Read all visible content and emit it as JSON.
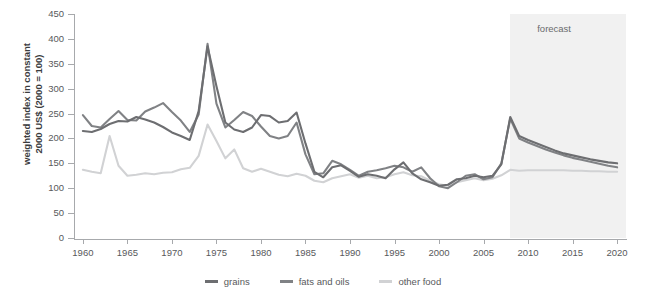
{
  "chart_data": {
    "type": "line",
    "title": "",
    "xlabel": "",
    "ylabel": "weighted index in constant\n2000 US$ (2000 = 100)",
    "xlim": [
      1959,
      2021
    ],
    "ylim": [
      0,
      450
    ],
    "ytick_values": [
      0,
      50,
      100,
      150,
      200,
      250,
      300,
      350,
      400,
      450
    ],
    "ytick_labels": [
      "0",
      "50",
      "100",
      "150",
      "200",
      "250",
      "300",
      "350",
      "400",
      "450"
    ],
    "xtick_values": [
      1960,
      1965,
      1970,
      1975,
      1980,
      1985,
      1990,
      1995,
      2000,
      2005,
      2010,
      2015,
      2020
    ],
    "xtick_labels": [
      "1960",
      "1965",
      "1970",
      "1975",
      "1980",
      "1985",
      "1990",
      "1995",
      "2000",
      "2005",
      "2010",
      "2015",
      "2020"
    ],
    "grid": false,
    "legend_position": "bottom-center",
    "annotations": [
      {
        "text": "forecast",
        "x": 2013.5,
        "y": 420,
        "name": "forecast-annotation"
      }
    ],
    "shaded_regions": [
      {
        "name": "forecast-band",
        "x_start": 2008,
        "x_end": 2021,
        "color": "#f1f1f1"
      }
    ],
    "x": [
      1960,
      1961,
      1962,
      1963,
      1964,
      1965,
      1966,
      1967,
      1968,
      1969,
      1970,
      1971,
      1972,
      1973,
      1974,
      1975,
      1976,
      1977,
      1978,
      1979,
      1980,
      1981,
      1982,
      1983,
      1984,
      1985,
      1986,
      1987,
      1988,
      1989,
      1990,
      1991,
      1992,
      1993,
      1994,
      1995,
      1996,
      1997,
      1998,
      1999,
      2000,
      2001,
      2002,
      2003,
      2004,
      2005,
      2006,
      2007,
      2008,
      2009,
      2010,
      2011,
      2012,
      2013,
      2014,
      2015,
      2016,
      2017,
      2018,
      2019,
      2020
    ],
    "series": [
      {
        "name": "grains",
        "color": "#6d6e71",
        "values": [
          215,
          213,
          219,
          229,
          235,
          234,
          243,
          238,
          232,
          223,
          212,
          205,
          197,
          255,
          385,
          305,
          232,
          218,
          213,
          222,
          247,
          245,
          232,
          235,
          252,
          190,
          133,
          122,
          142,
          146,
          135,
          123,
          128,
          125,
          120,
          138,
          152,
          130,
          118,
          112,
          105,
          107,
          118,
          120,
          125,
          122,
          125,
          148,
          243,
          205,
          197,
          190,
          183,
          176,
          170,
          166,
          162,
          158,
          155,
          152,
          150
        ]
      },
      {
        "name": "fats and oils",
        "color": "#808285",
        "values": [
          247,
          225,
          222,
          239,
          255,
          237,
          236,
          254,
          262,
          271,
          253,
          236,
          213,
          248,
          390,
          270,
          222,
          237,
          253,
          245,
          224,
          205,
          200,
          205,
          232,
          168,
          128,
          130,
          155,
          148,
          137,
          125,
          133,
          136,
          140,
          145,
          142,
          133,
          142,
          120,
          104,
          100,
          112,
          125,
          128,
          118,
          122,
          150,
          240,
          200,
          192,
          185,
          178,
          172,
          166,
          161,
          157,
          153,
          149,
          145,
          142
        ]
      },
      {
        "name": "other food",
        "color": "#d1d2d4",
        "values": [
          137,
          133,
          130,
          205,
          145,
          125,
          127,
          130,
          128,
          131,
          132,
          138,
          141,
          165,
          228,
          195,
          160,
          178,
          140,
          133,
          139,
          133,
          127,
          124,
          129,
          125,
          115,
          112,
          120,
          124,
          128,
          121,
          125,
          120,
          122,
          128,
          132,
          126,
          124,
          115,
          108,
          105,
          112,
          116,
          120,
          116,
          119,
          126,
          137,
          135,
          136,
          136,
          136,
          136,
          136,
          135,
          135,
          134,
          134,
          133,
          133
        ]
      }
    ]
  },
  "legend": {
    "items": [
      {
        "label": "grains",
        "color": "#6d6e71",
        "name": "legend-grains"
      },
      {
        "label": "fats and oils",
        "color": "#808285",
        "name": "legend-fats-and-oils"
      },
      {
        "label": "other food",
        "color": "#d1d2d4",
        "name": "legend-other-food"
      }
    ]
  }
}
